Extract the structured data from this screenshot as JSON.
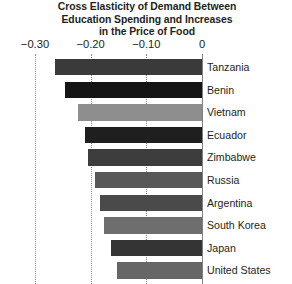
{
  "chart_data": {
    "type": "bar",
    "orientation": "horizontal",
    "title": "Cross Elasticity of Demand Between Education Spending and Increases in the Price of Food",
    "title_lines": [
      "Cross Elasticity of Demand Between",
      "Education Spending and Increases",
      "in the Price of Food"
    ],
    "xlabel": "",
    "ylabel": "",
    "xlim": [
      -0.3,
      0
    ],
    "xticks": [
      -0.3,
      -0.2,
      -0.1,
      0
    ],
    "xtick_labels": [
      "−0.30",
      "−0.20",
      "−0.10",
      "0"
    ],
    "grid": true,
    "grid_axis": "x",
    "legend": false,
    "categories": [
      "Tanzania",
      "Benin",
      "Vietnam",
      "Ecuador",
      "Zimbabwe",
      "Russia",
      "Argentina",
      "South Korea",
      "Japan",
      "United States"
    ],
    "values": [
      -0.264,
      -0.246,
      -0.223,
      -0.21,
      -0.205,
      -0.192,
      -0.183,
      -0.176,
      -0.163,
      -0.153
    ],
    "bar_colors": [
      "#3a3a3a",
      "#151515",
      "#8e8e8e",
      "#1f1f1f",
      "#3d3d3d",
      "#575757",
      "#4a4a4a",
      "#6e6e6e",
      "#343434",
      "#666666"
    ],
    "bars": [
      {
        "label": "Tanzania",
        "value": -0.264,
        "color": "#3a3a3a"
      },
      {
        "label": "Benin",
        "value": -0.246,
        "color": "#151515"
      },
      {
        "label": "Vietnam",
        "value": -0.223,
        "color": "#8e8e8e"
      },
      {
        "label": "Ecuador",
        "value": -0.21,
        "color": "#1f1f1f"
      },
      {
        "label": "Zimbabwe",
        "value": -0.205,
        "color": "#3d3d3d"
      },
      {
        "label": "Russia",
        "value": -0.192,
        "color": "#575757"
      },
      {
        "label": "Argentina",
        "value": -0.183,
        "color": "#4a4a4a"
      },
      {
        "label": "South Korea",
        "value": -0.176,
        "color": "#6e6e6e"
      },
      {
        "label": "Japan",
        "value": -0.163,
        "color": "#343434"
      },
      {
        "label": "United States",
        "value": -0.153,
        "color": "#666666"
      }
    ]
  }
}
